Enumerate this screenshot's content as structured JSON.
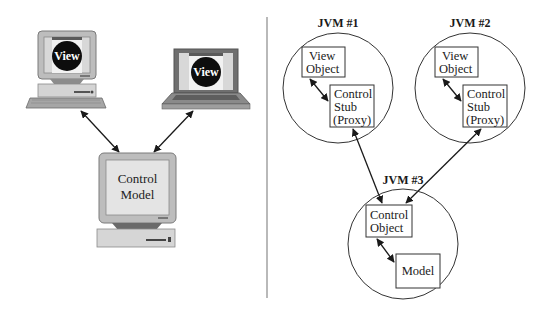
{
  "left_panel": {
    "desktop_client": {
      "screen_label": "View"
    },
    "laptop_client": {
      "screen_label": "View"
    },
    "server": {
      "line1": "Control",
      "line2": "Model"
    }
  },
  "right_panel": {
    "jvm1": {
      "title": "JVM #1",
      "view_box": {
        "line1": "View",
        "line2": "Object"
      },
      "stub_box": {
        "line1": "Control",
        "line2": "Stub",
        "line3": "(Proxy)"
      }
    },
    "jvm2": {
      "title": "JVM #2",
      "view_box": {
        "line1": "View",
        "line2": "Object"
      },
      "stub_box": {
        "line1": "Control",
        "line2": "Stub",
        "line3": "(Proxy)"
      }
    },
    "jvm3": {
      "title": "JVM #3",
      "control_box": {
        "line1": "Control",
        "line2": "Object"
      },
      "model_box": {
        "line1": "Model"
      }
    }
  },
  "colors": {
    "stroke": "#222222",
    "device_gray": "#b9b9b9",
    "device_dark": "#6f6f6f",
    "screen_light": "#e4e4e4",
    "divider": "#8a8a8a"
  }
}
